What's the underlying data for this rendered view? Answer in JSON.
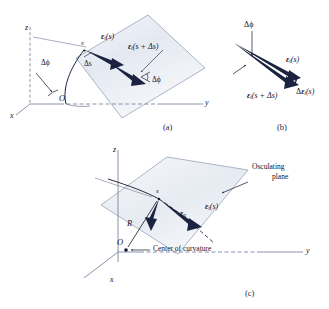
{
  "figure": {
    "background_color": "#ffffff",
    "ink_color": "#14142b",
    "plane_fill": "#e8ecf3",
    "plane_stroke": "#7b89a8",
    "vector_color": "#1b2340"
  },
  "panels": [
    {
      "id": "a",
      "caption": "(a)"
    },
    {
      "id": "b",
      "caption": "(b)"
    },
    {
      "id": "c",
      "caption": "(c)"
    }
  ],
  "panel_a": {
    "caption": "(a)",
    "axes": {
      "z": "z",
      "x": "x",
      "y": "y"
    },
    "origin_label": "O",
    "point_label": "s",
    "angle_label_origin": "Δϕ",
    "angle_label_tip": "Δϕ",
    "arc_length_label": "Δs",
    "vector_t_at_s": {
      "bold": "ε",
      "sub": "t",
      "arg": "(s)"
    },
    "vector_t_at_s_plus_ds": {
      "bold": "ε",
      "sub": "t",
      "arg": "(s + Δs)"
    }
  },
  "panel_b": {
    "caption": "(b)",
    "angle_label": "Δϕ",
    "vector_t_at_s": {
      "bold": "ε",
      "sub": "t",
      "arg": "(s)"
    },
    "vector_t_at_s_plus_ds": {
      "bold": "ε",
      "sub": "t",
      "arg": "(s + Δs)"
    },
    "vector_delta_t": {
      "delta": "Δ",
      "bold": "ε",
      "sub": "t",
      "arg": "(s)"
    }
  },
  "panel_c": {
    "caption": "(c)",
    "axes": {
      "z": "z",
      "x": "x",
      "y": "y"
    },
    "origin_label": "O",
    "point_label": "s",
    "radius_label": "R",
    "vector_t_at_s": {
      "bold": "ε",
      "sub": "t",
      "arg": "(s)"
    },
    "vector_n": {
      "bold": "ε",
      "sub": "n"
    },
    "osculating_plane_label_line1": "Osculating",
    "osculating_plane_label_line2": "plane",
    "center_of_curvature_label": "Center of curvature"
  }
}
